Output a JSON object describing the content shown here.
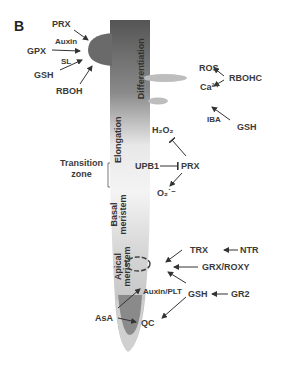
{
  "panel_label": "B",
  "zones": {
    "differentiation": "Differentiation",
    "elongation": "Elongation",
    "transition_zone": [
      "Transition",
      "zone"
    ],
    "basal_meristem": [
      "Basal",
      "meristem"
    ],
    "apical_meristem": [
      "Apical",
      "meristem"
    ]
  },
  "labels": {
    "prx_top": "PRX",
    "auxin": "Auxin",
    "gpx": "GPX",
    "sl": "SL",
    "gsh_left": "GSH",
    "rboh": "RBOH",
    "ros": "ROS",
    "rbohc": "RBOHC",
    "ca": "Ca²⁺",
    "iba": "IBA",
    "gsh_right": "GSH",
    "h2o2": "H₂O₂",
    "upb1": "UPB1",
    "prx_mid": "PRX",
    "o2": "O₂˙⁻",
    "trx": "TRX",
    "ntr": "NTR",
    "grx_roxy": "GRX/ROXY",
    "auxin_plt": "Auxin/PLT",
    "gsh_bottom": "GSH",
    "gr2": "GR2",
    "asa": "AsA",
    "qc": "QC"
  },
  "colors": {
    "root_top": "#5a5a5a",
    "root_mid": "#c8c8c8",
    "root_light": "#f2f2f2",
    "root_tip_outer": "#d0d0d0",
    "root_tip_inner": "#8a8a8a",
    "lateral_root": "#6a6a6a",
    "root_hair": "#bdbdbd",
    "arrow": "#333333"
  }
}
